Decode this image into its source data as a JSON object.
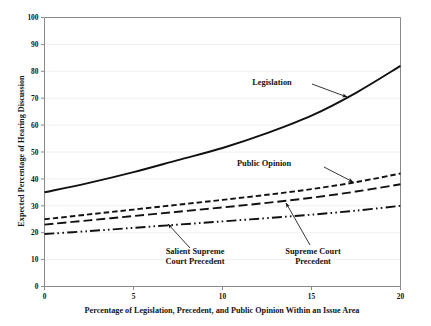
{
  "chart_data": {
    "type": "line",
    "title": "",
    "xlabel": "Percentage of Legislation, Precedent, and Public Opinion Within an Issue Area",
    "ylabel": "Expected Percentage of Hearing Discussion",
    "xlim": [
      0,
      20
    ],
    "ylim": [
      0,
      100
    ],
    "xticks": [
      0,
      5,
      10,
      15,
      20
    ],
    "yticks": [
      0,
      10,
      20,
      30,
      40,
      50,
      60,
      70,
      80,
      90,
      100
    ],
    "grid": true,
    "grid_axis": "y",
    "legend_position": "inline-annotations",
    "x": [
      0,
      2.5,
      5,
      7.5,
      10,
      12.5,
      15,
      17.5,
      20
    ],
    "series": [
      {
        "name": "Legislation",
        "style": "solid",
        "values": [
          35,
          38.5,
          42.5,
          47,
          51.5,
          57,
          63.5,
          72,
          82
        ]
      },
      {
        "name": "Public Opinion",
        "style": "dashed",
        "values": [
          25,
          26.8,
          28.6,
          30.4,
          32.2,
          34.1,
          36.2,
          38.8,
          42
        ]
      },
      {
        "name": "Supreme Court Precedent",
        "style": "long-dash",
        "values": [
          23,
          24.6,
          26.2,
          27.8,
          29.4,
          31.1,
          33,
          35.3,
          38
        ]
      },
      {
        "name": "Salient Supreme Court Precedent",
        "style": "dash-dot-dot",
        "values": [
          19.5,
          20.6,
          21.8,
          23,
          24.2,
          25.4,
          26.7,
          28.2,
          30
        ]
      }
    ],
    "annotations": [
      {
        "label": "Legislation",
        "line1": "Legislation",
        "line2": "",
        "text_x": 272,
        "text_y": 85,
        "arrow_from_x": 312,
        "arrow_from_y": 84,
        "arrow_to_x": 347,
        "arrow_to_y": 97
      },
      {
        "label": "Public Opinion",
        "line1": "Public Opinion",
        "line2": "",
        "text_x": 264,
        "text_y": 166,
        "arrow_from_x": 324,
        "arrow_from_y": 167,
        "arrow_to_x": 353,
        "arrow_to_y": 182
      },
      {
        "label": "Supreme Court Precedent",
        "line1": "Supreme Court",
        "line2": "Precedent",
        "text_x": 313,
        "text_y": 254,
        "arrow_from_x": 310,
        "arrow_from_y": 245,
        "arrow_to_x": 286,
        "arrow_to_y": 203
      },
      {
        "label": "Salient Supreme Court Precedent",
        "line1": "Salient Supreme",
        "line2": "Court Precedent",
        "text_x": 195,
        "text_y": 254,
        "arrow_from_x": 190,
        "arrow_from_y": 248,
        "arrow_to_x": 168,
        "arrow_to_y": 224
      }
    ],
    "colors": {
      "line": "#111111",
      "axis": "#8a8a8a",
      "grid": "#f0f0f0",
      "text": "#141414",
      "background": "#ffffff"
    }
  }
}
